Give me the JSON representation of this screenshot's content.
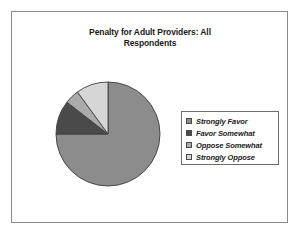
{
  "chart_data": {
    "type": "pie",
    "title": "Penalty for Adult Providers: All Respondents",
    "title_line1": "Penalty for Adult Providers: All",
    "title_line2": "Respondents",
    "xlabel": "",
    "ylabel": "",
    "legend_position": "right",
    "grid": false,
    "start_angle_deg": 0,
    "direction": "clockwise",
    "categories": [
      "Strongly Favor",
      "Favor Somewhat",
      "Oppose Somewhat",
      "Strongly Oppose"
    ],
    "values": [
      75,
      10.5,
      4.5,
      10
    ],
    "value_unit": "percent",
    "slices": [
      {
        "label": "Strongly Favor",
        "value": 75,
        "color": "#8c8c8c",
        "sweep_deg": 270
      },
      {
        "label": "Favor Somewhat",
        "value": 10.5,
        "color": "#4a4a4a",
        "sweep_deg": 37.8
      },
      {
        "label": "Oppose Somewhat",
        "value": 4.5,
        "color": "#ababab",
        "sweep_deg": 16.2
      },
      {
        "label": "Strongly Oppose",
        "value": 10,
        "color": "#d6d6d6",
        "sweep_deg": 36
      }
    ]
  },
  "legend": {
    "items": [
      {
        "label": "Strongly Favor",
        "color": "#8c8c8c"
      },
      {
        "label": "Favor Somewhat",
        "color": "#4a4a4a"
      },
      {
        "label": "Oppose Somewhat",
        "color": "#ababab"
      },
      {
        "label": "Strongly Oppose",
        "color": "#d6d6d6"
      }
    ]
  },
  "colors": {
    "frame_border": "#8a8a8a",
    "legend_border": "#6e6e6e",
    "slice_outline": "#3d3d3d",
    "background": "#ffffff",
    "text": "#1a1a1a"
  }
}
